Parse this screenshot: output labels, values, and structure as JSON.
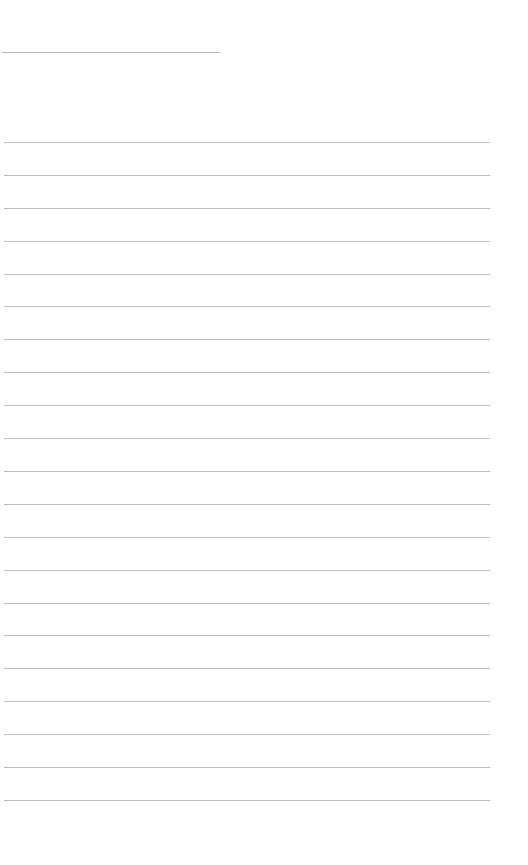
{
  "page": {
    "type": "blank lined notebook page",
    "background_color": "#ffffff",
    "line_color": "#bdbdbd"
  },
  "title_line": {
    "text": ""
  },
  "lines": [
    {
      "text": ""
    },
    {
      "text": ""
    },
    {
      "text": ""
    },
    {
      "text": ""
    },
    {
      "text": ""
    },
    {
      "text": ""
    },
    {
      "text": ""
    },
    {
      "text": ""
    },
    {
      "text": ""
    },
    {
      "text": ""
    },
    {
      "text": ""
    },
    {
      "text": ""
    },
    {
      "text": ""
    },
    {
      "text": ""
    },
    {
      "text": ""
    },
    {
      "text": ""
    },
    {
      "text": ""
    },
    {
      "text": ""
    },
    {
      "text": ""
    },
    {
      "text": ""
    },
    {
      "text": ""
    }
  ]
}
